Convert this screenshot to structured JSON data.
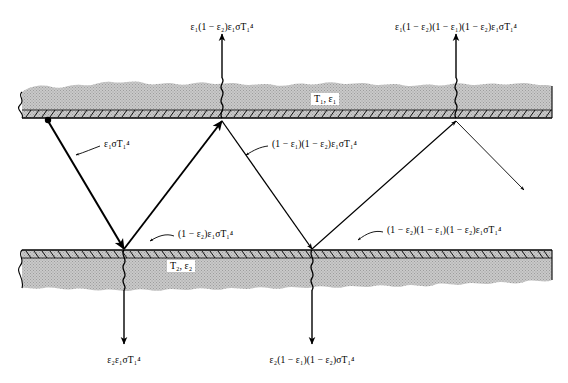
{
  "figure": {
    "background_color": "#ffffff",
    "line_color": "#000000",
    "plate_fill_color": "#c8c8c8",
    "width": 568,
    "height": 383
  },
  "plates": {
    "top": {
      "tag": "T₁, ε₁",
      "tag_temperature": "T₁",
      "tag_emissivity": "ε₁",
      "surface_y": 118,
      "name": "upper-plate"
    },
    "bottom": {
      "tag": "T₂, ε₂",
      "tag_temperature": "T₂",
      "tag_emissivity": "ε₂",
      "surface_y": 250,
      "name": "lower-plate"
    }
  },
  "labels": {
    "emitted_from_top": "ε₁σT₁⁴",
    "reflected_from_bottom_1": "(1 − ε₂)ε₁σT₁⁴",
    "reflected_from_top_1": "(1 − ε₁)(1 − ε₂)ε₁σT₁⁴",
    "reflected_from_bottom_2": "(1 − ε₂)(1 − ε₁)(1 − ε₂)ε₁σT₁⁴",
    "absorbed_top_1": "ε₁(1 − ε₂)ε₁σT₁⁴",
    "absorbed_top_2": "ε₁(1 − ε₂)(1 − ε₁)(1 − ε₂)ε₁σT₁⁴",
    "absorbed_bottom_1": "ε₂ε₁σT₁⁴",
    "absorbed_bottom_2": "ε₂(1 − ε₁)(1 − ε₂)σT₁⁴"
  }
}
